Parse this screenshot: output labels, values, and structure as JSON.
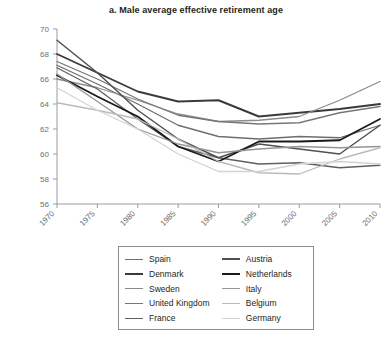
{
  "chart": {
    "title": "a. Male average effective retirement age",
    "ylabel": "Age at retirement"
  },
  "chart_data": {
    "type": "line",
    "title": "a. Male average effective retirement age",
    "xlabel": "",
    "ylabel": "Age at retirement",
    "xlim": [
      1970,
      2010
    ],
    "ylim": [
      56,
      70
    ],
    "ytick_values": [
      56,
      58,
      60,
      62,
      64,
      66,
      68,
      70
    ],
    "ytick_labels": [
      "56",
      "58",
      "60",
      "62",
      "64",
      "66",
      "68",
      "70"
    ],
    "xtick_values": [
      1970,
      1975,
      1980,
      1985,
      1990,
      1995,
      2000,
      2005,
      2010
    ],
    "xtick_labels": [
      "1970",
      "1975",
      "1980",
      "1985",
      "1990",
      "1995",
      "2000",
      "2005",
      "2010"
    ],
    "x": [
      1970,
      1975,
      1980,
      1985,
      1990,
      1995,
      2000,
      2005,
      2010
    ],
    "grid": false,
    "legend_position": "below",
    "series": [
      {
        "name": "Spain",
        "color": "#6d6e71",
        "width": 1.3,
        "values": [
          67.1,
          65.6,
          64.0,
          62.3,
          61.4,
          61.2,
          61.4,
          61.3,
          62.3
        ]
      },
      {
        "name": "Denmark",
        "color": "#3a3a3c",
        "width": 1.9,
        "values": [
          68.0,
          66.5,
          65.0,
          64.2,
          64.3,
          63.0,
          63.3,
          63.6,
          64.0
        ]
      },
      {
        "name": "Sweden",
        "color": "#8a8b8d",
        "width": 1.3,
        "values": [
          66.0,
          65.3,
          64.3,
          63.2,
          62.6,
          62.7,
          63.0,
          64.3,
          65.8
        ]
      },
      {
        "name": "United Kingdom",
        "color": "#76777a",
        "width": 1.3,
        "values": [
          67.4,
          66.0,
          64.4,
          63.1,
          62.6,
          62.4,
          62.5,
          63.3,
          63.8
        ]
      },
      {
        "name": "France",
        "color": "#5e5f62",
        "width": 1.3,
        "values": [
          66.9,
          65.2,
          62.8,
          60.6,
          59.7,
          59.2,
          59.3,
          58.9,
          59.1
        ]
      },
      {
        "name": "Austria",
        "color": "#4f5052",
        "width": 1.5,
        "values": [
          69.1,
          66.5,
          63.5,
          61.2,
          59.7,
          60.8,
          60.4,
          60.0,
          62.3
        ]
      },
      {
        "name": "Netherlands",
        "color": "#1a1a1a",
        "width": 1.8,
        "values": [
          66.3,
          64.6,
          63.0,
          60.6,
          59.4,
          61.0,
          61.0,
          61.1,
          62.8
        ]
      },
      {
        "name": "Italy",
        "color": "#949598",
        "width": 1.3,
        "values": [
          66.4,
          64.2,
          62.0,
          60.8,
          60.1,
          60.4,
          60.6,
          60.5,
          60.6
        ]
      },
      {
        "name": "Belgium",
        "color": "#b9babc",
        "width": 1.3,
        "values": [
          64.1,
          63.5,
          62.8,
          61.2,
          59.4,
          58.5,
          58.4,
          59.6,
          60.5
        ]
      },
      {
        "name": "Germany",
        "color": "#d2d3d5",
        "width": 1.3,
        "values": [
          65.3,
          63.5,
          62.0,
          60.0,
          58.6,
          58.6,
          59.2,
          59.4,
          59.2
        ]
      }
    ]
  },
  "legend": {
    "columns": [
      {
        "entries": [
          {
            "label": "Spain",
            "color": "#6d6e71",
            "width": 1.8
          },
          {
            "label": "Denmark",
            "color": "#3a3a3c",
            "width": 2.6
          },
          {
            "label": "Sweden",
            "color": "#8a8b8d",
            "width": 1.8
          },
          {
            "label": "United Kingdom",
            "color": "#76777a",
            "width": 1.8
          },
          {
            "label": "France",
            "color": "#5e5f62",
            "width": 1.8
          }
        ]
      },
      {
        "entries": [
          {
            "label": "Austria",
            "color": "#4f5052",
            "width": 2.2
          },
          {
            "label": "Netherlands",
            "color": "#1a1a1a",
            "width": 2.8
          },
          {
            "label": "Italy",
            "color": "#949598",
            "width": 1.8
          },
          {
            "label": "Belgium",
            "color": "#b9babc",
            "width": 1.8
          },
          {
            "label": "Germany",
            "color": "#d2d3d5",
            "width": 1.8
          }
        ]
      }
    ]
  }
}
